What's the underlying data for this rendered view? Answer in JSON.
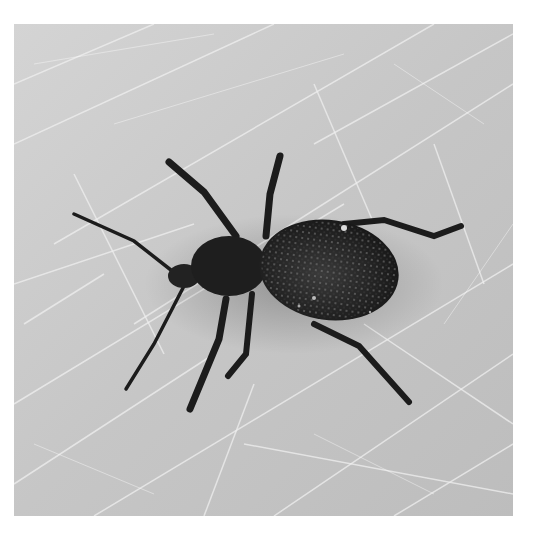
{
  "image": {
    "subject": "weevil beetle",
    "description": "Black-and-white photo of a dark weevil with long legs and antennae on a scratched light gray surface",
    "colors": {
      "background_page": "#ffffff",
      "surface": "#c8c8c8",
      "surface_highlight": "#eeeeee",
      "beetle_body": "#1e1e1e",
      "beetle_elytra": "#2a2a2a",
      "speckle": "#9a9a9a"
    }
  }
}
